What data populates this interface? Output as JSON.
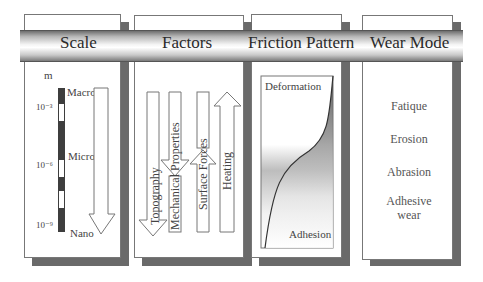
{
  "header": {
    "columns": [
      "Scale",
      "Factors",
      "Friction Pattern",
      "Wear Mode"
    ]
  },
  "scale": {
    "unit": "m",
    "ticks": [
      "10⁻³",
      "10⁻⁶",
      "10⁻⁹"
    ],
    "levels": [
      "Macro",
      "Micro",
      "Nano"
    ],
    "arrow_direction": "down"
  },
  "factors": {
    "items": [
      {
        "label": "Topography",
        "arrow": "down"
      },
      {
        "label": "Mechanical Properties",
        "arrow": "down"
      },
      {
        "label": "Surface Forces",
        "arrow": "up"
      },
      {
        "label": "Heating",
        "arrow": "up"
      }
    ]
  },
  "friction_pattern": {
    "top_label": "Deformation",
    "bottom_label": "Adhesion"
  },
  "wear_mode": {
    "items": [
      "Fatique",
      "Erosion",
      "Abrasion",
      "Adhesive wear"
    ]
  },
  "colors": {
    "shadow": "#6a6a6a",
    "border": "#777777",
    "bar_dark": "#444444"
  }
}
